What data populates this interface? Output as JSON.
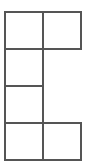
{
  "diagram": {
    "type": "grid-shape",
    "line_color": "#555555",
    "background": "#ffffff",
    "cell_size": 39,
    "rows": 4,
    "cols": 2,
    "cells": [
      {
        "row": 0,
        "col": 0
      },
      {
        "row": 0,
        "col": 1
      },
      {
        "row": 1,
        "col": 0
      },
      {
        "row": 2,
        "col": 0
      },
      {
        "row": 3,
        "col": 0
      },
      {
        "row": 3,
        "col": 1
      }
    ]
  }
}
